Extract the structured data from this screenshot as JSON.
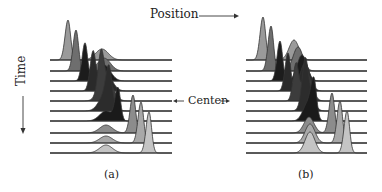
{
  "labels": {
    "position": "Position",
    "time": "Time",
    "center": "Center",
    "panel_a": "(a)",
    "panel_b": "(b)"
  },
  "colors": {
    "line": "#333333",
    "shades": [
      "#9a9a9a",
      "#6e6e6e",
      "#1c1c1c",
      "#2a2a2a",
      "#3c3c3c",
      "#2c2c2c",
      "#1a1a1a",
      "#8c8c8c",
      "#a8a8a8",
      "#c4c4c4"
    ]
  },
  "layout": {
    "baselines_y": [
      60,
      71,
      81,
      91,
      101,
      111,
      121,
      133,
      143,
      153
    ],
    "panels": [
      {
        "id": "a",
        "x0": 50,
        "x1": 172,
        "peak1_x": [
          68,
          76,
          85,
          93,
          101,
          109,
          118,
          133,
          141,
          149
        ],
        "peak1_h": [
          40,
          41,
          38,
          37,
          34,
          30,
          32,
          38,
          41,
          41
        ],
        "peak2_x": [
          102,
          104,
          104,
          105,
          106,
          106,
          106,
          106,
          106,
          106
        ],
        "peak2_h": [
          11,
          13,
          16,
          20,
          24,
          18,
          10,
          8,
          7,
          8
        ],
        "w1": 4.2,
        "w2": 9
      },
      {
        "id": "b",
        "x0": 246,
        "x1": 367,
        "peak1_x": [
          263,
          271,
          280,
          288,
          296,
          305,
          314,
          332,
          340,
          347
        ],
        "peak1_h": [
          43,
          45,
          40,
          38,
          36,
          33,
          35,
          40,
          42,
          42
        ],
        "peak2_x": [
          294,
          298,
          302,
          305,
          307,
          308,
          308,
          309,
          310,
          310
        ],
        "peak2_h": [
          20,
          24,
          26,
          28,
          28,
          24,
          18,
          16,
          19,
          21
        ],
        "w1": 4.2,
        "w2": 7
      }
    ]
  }
}
